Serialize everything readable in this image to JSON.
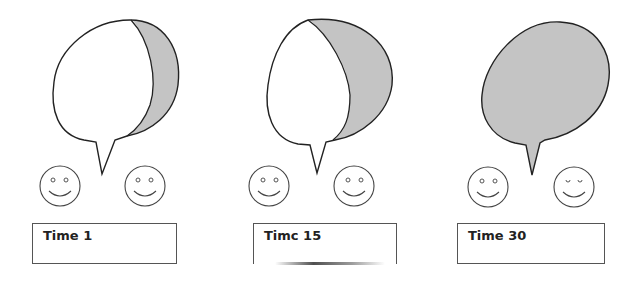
{
  "figure": {
    "fill_color": "#c4c4c4",
    "stroke_color": "#222222",
    "panels": [
      {
        "label": "Time 1",
        "fill_state": "mostly-empty",
        "faces": [
          "smiley",
          "smiley"
        ]
      },
      {
        "label": "Timc 15",
        "fill_state": "partially-filled",
        "faces": [
          "smiley",
          "smiley"
        ]
      },
      {
        "label": "Time 30",
        "fill_state": "fully-filled",
        "faces": [
          "smiley",
          "smiley"
        ]
      }
    ]
  }
}
